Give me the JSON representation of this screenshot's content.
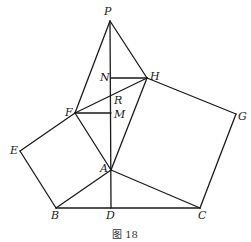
{
  "figure": {
    "caption": "图 18",
    "points": {
      "P": {
        "label": "P",
        "x": 110,
        "y": 21,
        "lx": 104,
        "ly": 15
      },
      "H": {
        "label": "H",
        "x": 147,
        "y": 78,
        "lx": 150,
        "ly": 80
      },
      "G": {
        "label": "G",
        "x": 236,
        "y": 114,
        "lx": 238,
        "ly": 120
      },
      "N": {
        "label": "N",
        "x": 111,
        "y": 78,
        "lx": 100,
        "ly": 81
      },
      "R": {
        "label": "R",
        "x": 111,
        "y": 97,
        "lx": 114,
        "ly": 104
      },
      "F": {
        "label": "F",
        "x": 75,
        "y": 113,
        "lx": 65,
        "ly": 116
      },
      "M": {
        "label": "M",
        "x": 111,
        "y": 113,
        "lx": 114,
        "ly": 118
      },
      "E": {
        "label": "E",
        "x": 20,
        "y": 151,
        "lx": 10,
        "ly": 154
      },
      "A": {
        "label": "A",
        "x": 111,
        "y": 170,
        "lx": 100,
        "ly": 172
      },
      "B": {
        "label": "B",
        "x": 56,
        "y": 208,
        "lx": 51,
        "ly": 219
      },
      "D": {
        "label": "D",
        "x": 111,
        "y": 208,
        "lx": 106,
        "ly": 219
      },
      "C": {
        "label": "C",
        "x": 200,
        "y": 208,
        "lx": 198,
        "ly": 219
      }
    },
    "segments": [
      [
        "P",
        "F"
      ],
      [
        "P",
        "H"
      ],
      [
        "P",
        "D"
      ],
      [
        "N",
        "H"
      ],
      [
        "F",
        "M"
      ],
      [
        "F",
        "H"
      ],
      [
        "F",
        "A"
      ],
      [
        "H",
        "A"
      ],
      [
        "E",
        "F"
      ],
      [
        "E",
        "B"
      ],
      [
        "B",
        "A"
      ],
      [
        "B",
        "C"
      ],
      [
        "A",
        "C"
      ],
      [
        "H",
        "G"
      ],
      [
        "G",
        "C"
      ]
    ]
  }
}
